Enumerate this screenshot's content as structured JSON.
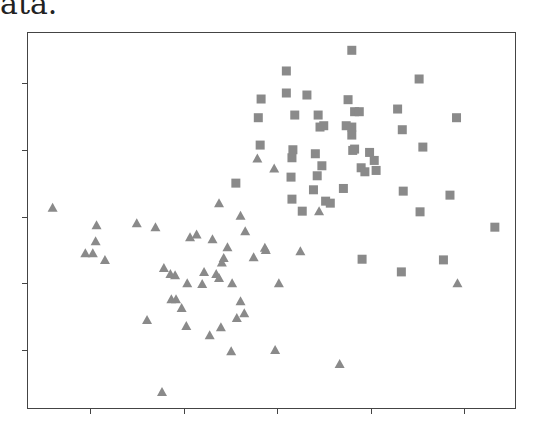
{
  "caption_fragment": "ata.",
  "marker_color": "#8a8a8a",
  "frame_color": "#444444",
  "chart_data": {
    "type": "scatter",
    "title": "",
    "xlabel": "",
    "ylabel": "",
    "x_ticks": [
      1,
      2,
      3,
      4,
      5
    ],
    "y_ticks": [
      1,
      2,
      3,
      4,
      5
    ],
    "x_tick_labels": [
      "",
      "",
      "",
      "",
      ""
    ],
    "y_tick_labels": [
      "",
      "",
      "",
      "",
      ""
    ],
    "xlim": [
      0.38,
      5.27
    ],
    "ylim": [
      0.39,
      5.77
    ],
    "grid": false,
    "legend": null,
    "series": [
      {
        "name": "triangles",
        "marker": "triangle",
        "color": "#8a8a8a",
        "points": [
          [
            0.6,
            3.13
          ],
          [
            1.07,
            2.87
          ],
          [
            1.06,
            2.63
          ],
          [
            0.95,
            2.45
          ],
          [
            1.03,
            2.45
          ],
          [
            1.16,
            2.35
          ],
          [
            1.5,
            2.9
          ],
          [
            1.7,
            2.84
          ],
          [
            2.38,
            3.2
          ],
          [
            2.61,
            3.01
          ],
          [
            2.66,
            2.78
          ],
          [
            2.07,
            2.69
          ],
          [
            2.14,
            2.73
          ],
          [
            2.31,
            2.66
          ],
          [
            2.47,
            2.54
          ],
          [
            2.43,
            2.38
          ],
          [
            2.41,
            2.31
          ],
          [
            2.75,
            2.39
          ],
          [
            2.87,
            2.53
          ],
          [
            2.88,
            2.5
          ],
          [
            1.79,
            2.23
          ],
          [
            1.86,
            2.14
          ],
          [
            1.91,
            2.12
          ],
          [
            2.04,
            2.0
          ],
          [
            2.22,
            2.17
          ],
          [
            2.2,
            1.99
          ],
          [
            2.35,
            2.14
          ],
          [
            2.38,
            2.08
          ],
          [
            2.52,
            2.0
          ],
          [
            3.02,
            2.0
          ],
          [
            1.87,
            1.76
          ],
          [
            1.92,
            1.76
          ],
          [
            1.98,
            1.63
          ],
          [
            1.61,
            1.45
          ],
          [
            2.03,
            1.36
          ],
          [
            2.28,
            1.22
          ],
          [
            2.4,
            1.34
          ],
          [
            2.61,
            1.73
          ],
          [
            2.65,
            1.55
          ],
          [
            2.57,
            1.48
          ],
          [
            2.98,
            1.0
          ],
          [
            2.51,
            0.98
          ],
          [
            1.77,
            0.37
          ],
          [
            2.79,
            3.87
          ],
          [
            2.97,
            3.72
          ],
          [
            3.45,
            3.08
          ],
          [
            3.25,
            2.48
          ],
          [
            4.93,
            2.0
          ],
          [
            3.67,
            0.79
          ]
        ]
      },
      {
        "name": "squares",
        "marker": "square",
        "color": "#8a8a8a",
        "points": [
          [
            3.8,
            5.49
          ],
          [
            3.1,
            5.18
          ],
          [
            2.83,
            4.76
          ],
          [
            3.1,
            4.85
          ],
          [
            3.32,
            4.82
          ],
          [
            3.76,
            4.75
          ],
          [
            3.83,
            4.57
          ],
          [
            3.88,
            4.57
          ],
          [
            3.19,
            4.52
          ],
          [
            3.44,
            4.52
          ],
          [
            3.74,
            4.36
          ],
          [
            3.8,
            4.34
          ],
          [
            3.46,
            4.34
          ],
          [
            3.5,
            4.36
          ],
          [
            3.17,
            4.0
          ],
          [
            3.8,
            4.22
          ],
          [
            2.82,
            4.07
          ],
          [
            3.83,
            4.01
          ],
          [
            3.16,
            3.88
          ],
          [
            3.41,
            3.94
          ],
          [
            3.81,
            3.99
          ],
          [
            3.99,
            3.96
          ],
          [
            4.04,
            3.84
          ],
          [
            3.48,
            3.76
          ],
          [
            2.8,
            4.48
          ],
          [
            3.15,
            3.59
          ],
          [
            3.43,
            3.61
          ],
          [
            3.9,
            3.73
          ],
          [
            3.94,
            3.67
          ],
          [
            4.06,
            3.69
          ],
          [
            3.39,
            3.4
          ],
          [
            3.71,
            3.42
          ],
          [
            3.16,
            3.26
          ],
          [
            3.52,
            3.23
          ],
          [
            3.57,
            3.2
          ],
          [
            3.27,
            3.08
          ],
          [
            2.56,
            3.5
          ],
          [
            4.52,
            5.06
          ],
          [
            4.29,
            4.61
          ],
          [
            4.92,
            4.48
          ],
          [
            4.34,
            4.3
          ],
          [
            4.56,
            4.04
          ],
          [
            4.35,
            3.38
          ],
          [
            4.85,
            3.32
          ],
          [
            4.53,
            3.07
          ],
          [
            5.33,
            2.84
          ],
          [
            4.78,
            2.35
          ],
          [
            3.91,
            2.36
          ],
          [
            4.33,
            2.17
          ]
        ]
      }
    ]
  }
}
